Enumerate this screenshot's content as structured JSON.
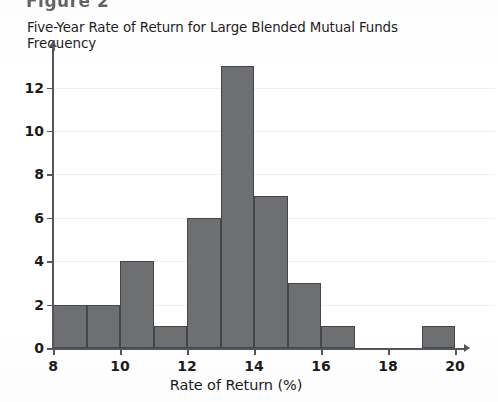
{
  "figure_header": "Figure 2",
  "title": "Five-Year Rate of Return for Large Blended Mutual Funds",
  "ylabel": "Frequency",
  "xlabel": "Rate of Return (%)",
  "colors": {
    "bar_fill": "#6e6f71",
    "bar_border": "#44454a",
    "axis": "#55565a",
    "gridline": "#f0f0f0",
    "text": "#1b1b1b",
    "background": "#ffffff"
  },
  "axes": {
    "x_ticks": [
      8,
      10,
      12,
      14,
      16,
      18,
      20
    ],
    "y_ticks": [
      0,
      2,
      4,
      6,
      8,
      10,
      12
    ],
    "x_min": 8,
    "x_max": 20,
    "y_min": 0,
    "y_max": 13.5
  },
  "chart_data": {
    "type": "bar",
    "title": "Five-Year Rate of Return for Large Blended Mutual Funds",
    "xlabel": "Rate of Return (%)",
    "ylabel": "Frequency",
    "xlim": [
      8,
      20
    ],
    "ylim": [
      0,
      13.5
    ],
    "grid": true,
    "legend": "none",
    "bin_width": 1,
    "bin_edges": [
      8,
      9,
      10,
      11,
      12,
      13,
      14,
      15,
      16,
      17,
      19,
      20
    ],
    "categories": [
      "8-9",
      "9-10",
      "10-11",
      "11-12",
      "12-13",
      "13-14",
      "14-15",
      "15-16",
      "16-17",
      "19-20"
    ],
    "values": [
      2,
      2,
      4,
      1,
      6,
      13,
      7,
      3,
      1,
      1
    ],
    "bars": [
      {
        "bin_start": 8,
        "bin_end": 9,
        "frequency": 2
      },
      {
        "bin_start": 9,
        "bin_end": 10,
        "frequency": 2
      },
      {
        "bin_start": 10,
        "bin_end": 11,
        "frequency": 4
      },
      {
        "bin_start": 11,
        "bin_end": 12,
        "frequency": 1
      },
      {
        "bin_start": 12,
        "bin_end": 13,
        "frequency": 6
      },
      {
        "bin_start": 13,
        "bin_end": 14,
        "frequency": 13
      },
      {
        "bin_start": 14,
        "bin_end": 15,
        "frequency": 7
      },
      {
        "bin_start": 15,
        "bin_end": 16,
        "frequency": 3
      },
      {
        "bin_start": 16,
        "bin_end": 17,
        "frequency": 1
      },
      {
        "bin_start": 19,
        "bin_end": 20,
        "frequency": 1
      }
    ],
    "total_count": 40
  }
}
